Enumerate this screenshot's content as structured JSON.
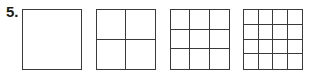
{
  "problem": {
    "number_label": "5.",
    "figures": [
      {
        "rows": 1,
        "cols": 1,
        "left": 22
      },
      {
        "rows": 2,
        "cols": 2,
        "left": 96
      },
      {
        "rows": 3,
        "cols": 3,
        "left": 170
      },
      {
        "rows": 4,
        "cols": 4,
        "left": 243
      }
    ]
  }
}
